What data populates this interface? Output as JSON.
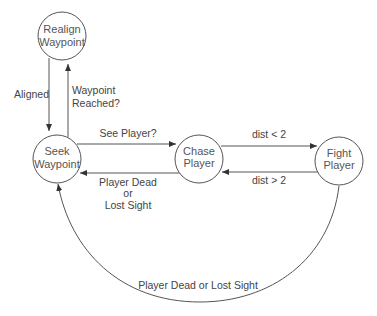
{
  "diagram": {
    "type": "state-machine",
    "states": [
      {
        "id": "realign",
        "line1": "Realign",
        "line2": "Waypoint"
      },
      {
        "id": "seek",
        "line1": "Seek",
        "line2": "Waypoint"
      },
      {
        "id": "chase",
        "line1": "Chase",
        "line2": "Player"
      },
      {
        "id": "fight",
        "line1": "Fight",
        "line2": "Player"
      }
    ],
    "transitions": [
      {
        "from": "realign",
        "to": "seek",
        "label": "Aligned"
      },
      {
        "from": "seek",
        "to": "realign",
        "line1": "Waypoint",
        "line2": "Reached?"
      },
      {
        "from": "seek",
        "to": "chase",
        "label": "See Player?"
      },
      {
        "from": "chase",
        "to": "seek",
        "line1": "Player Dead",
        "line2": "or",
        "line3": "Lost Sight"
      },
      {
        "from": "chase",
        "to": "fight",
        "label": "dist < 2"
      },
      {
        "from": "fight",
        "to": "chase",
        "label": "dist > 2"
      },
      {
        "from": "fight",
        "to": "seek",
        "label": "Player Dead or Lost Sight"
      }
    ],
    "colors": {
      "stroke": "#555555",
      "text": "#444444",
      "background": "#ffffff"
    }
  }
}
